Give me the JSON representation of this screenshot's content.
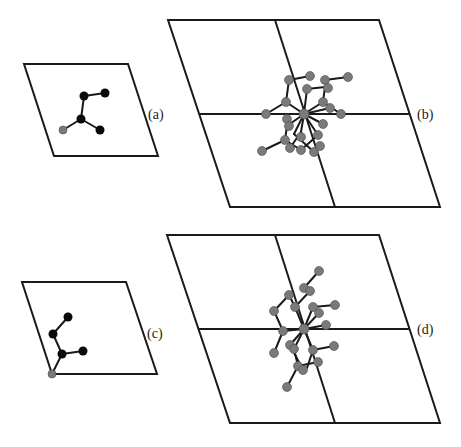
{
  "figure": {
    "panels": [
      {
        "id": "a",
        "label": "(a)",
        "type": "single-cell",
        "description": "molecule on single unit cell"
      },
      {
        "id": "b",
        "label": "(b)",
        "type": "2x2-supercell",
        "description": "symmetry-expanded configuration"
      },
      {
        "id": "c",
        "label": "(c)",
        "type": "single-cell",
        "description": "molecule on single unit cell, alternate site"
      },
      {
        "id": "d",
        "label": "(d)",
        "type": "2x2-supercell",
        "description": "symmetry-expanded configuration, alternate site"
      }
    ],
    "colors": {
      "cell_line": "#1a1a1a",
      "atom_primary": "#0a0a0a",
      "atom_secondary": "#7a7a7a",
      "background": "#ffffff"
    }
  }
}
